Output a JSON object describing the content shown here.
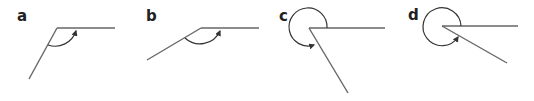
{
  "diagram": {
    "colors": {
      "line": "#555555",
      "label": "#222222"
    },
    "panels": [
      {
        "label": "a",
        "angle_type": "obtuse"
      },
      {
        "label": "b",
        "angle_type": "obtuse"
      },
      {
        "label": "c",
        "angle_type": "reflex"
      },
      {
        "label": "d",
        "angle_type": "reflex"
      }
    ]
  }
}
